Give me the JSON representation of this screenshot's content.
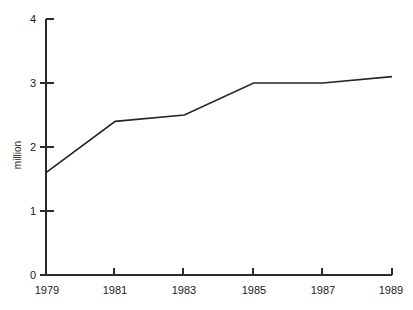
{
  "chart_data": {
    "type": "line",
    "title": "",
    "subtitle": "",
    "xlabel": "",
    "ylabel": "million",
    "categories": [
      "1979",
      "1981",
      "1983",
      "1985",
      "1987",
      "1989"
    ],
    "x": [
      1979,
      1981,
      1983,
      1985,
      1987,
      1989
    ],
    "values": [
      1.6,
      2.4,
      2.5,
      3.0,
      3.0,
      3.1
    ],
    "series": [
      {
        "name": "million",
        "values": [
          1.6,
          2.4,
          2.5,
          3.0,
          3.0,
          3.1
        ]
      }
    ],
    "xlim": [
      1979,
      1989
    ],
    "ylim": [
      0,
      4
    ],
    "y_ticks": [
      "0",
      "1",
      "2",
      "3",
      "4"
    ],
    "y_tick_values": [
      0,
      1,
      2,
      3,
      4
    ],
    "x_ticks": [
      "1979",
      "1981",
      "1983",
      "1985",
      "1987",
      "1989"
    ],
    "x_tick_values": [
      1979,
      1981,
      1983,
      1985,
      1987,
      1989
    ],
    "grid": false,
    "legend": false,
    "legend_position": "none",
    "line_color": "#262626",
    "axis_color": "#2b2b2b",
    "background_color": "#ffffff",
    "markers": false
  },
  "axes": {
    "y_axis_title": "million",
    "y_tick_labels": [
      "4",
      "3",
      "2",
      "1",
      "0"
    ],
    "x_tick_labels": [
      "1979",
      "1981",
      "1983",
      "1985",
      "1987",
      "1989"
    ]
  }
}
